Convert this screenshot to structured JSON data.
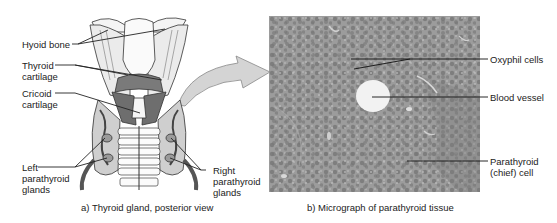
{
  "panel_a": {
    "caption": "a) Thyroid gland, posterior view",
    "labels": {
      "hyoid_bone": "Hyoid bone",
      "thyroid_cartilage": "Thyroid\ncartilage",
      "cricoid_cartilage": "Cricoid\ncartilage",
      "left_parathyroid": "Left\nparathyroid\nglands",
      "right_parathyroid": "Right\nparathyroid\nglands"
    }
  },
  "panel_b": {
    "caption": "b) Micrograph of parathyroid tissue",
    "labels": {
      "oxyphil": "Oxyphil cells",
      "blood_vessel": "Blood vessel",
      "chief_cell": "Parathyroid\n(chief) cell"
    }
  },
  "colors": {
    "background": "#ffffff",
    "micrograph_gray": "#9a9a9a",
    "arrow_fill": "#d4d4d4",
    "leader_line": "#222222"
  }
}
